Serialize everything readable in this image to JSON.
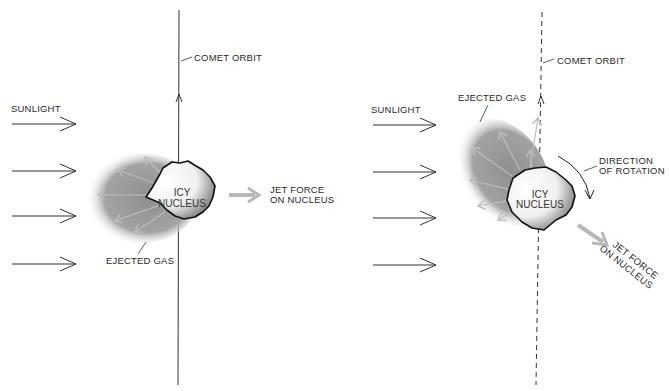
{
  "panels": [
    {
      "id": "left",
      "labels": {
        "orbit": "COMET ORBIT",
        "sunlight": "SUNLIGHT",
        "nucleus_line1": "ICY",
        "nucleus_line2": "NUCLEUS",
        "ejected_gas": "EJECTED GAS",
        "jet_line1": "JET FORCE",
        "jet_line2": "ON NUCLEUS"
      },
      "orbit_style": "solid"
    },
    {
      "id": "right",
      "labels": {
        "orbit": "COMET ORBIT",
        "sunlight": "SUNLIGHT",
        "nucleus_line1": "ICY",
        "nucleus_line2": "NUCLEUS",
        "ejected_gas": "EJECTED GAS",
        "rotation_line1": "DIRECTION",
        "rotation_line2": "OF ROTATION",
        "jet_line1": "JET FORCE",
        "jet_line2": "ON NUCLEUS"
      },
      "orbit_style": "dashed"
    }
  ],
  "colors": {
    "gas_cloud": "#9a9a9a",
    "jet_arrow": "#b8b8b8",
    "line": "#333333"
  }
}
